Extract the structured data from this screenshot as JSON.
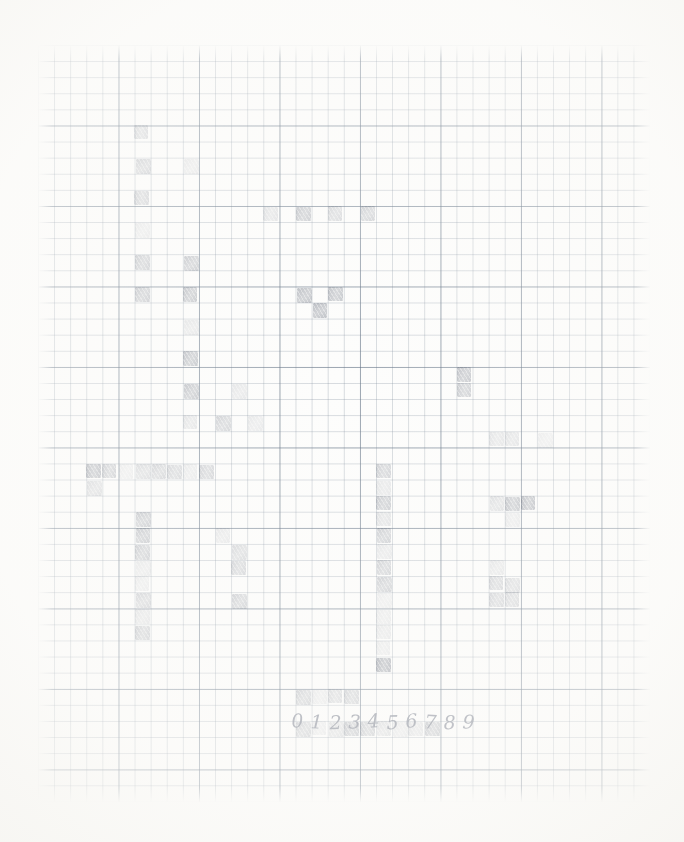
{
  "document": {
    "title": "Graph paper pencil grid drawing",
    "medium": "pencil on graph paper",
    "paper_color": "#fdfdfc",
    "grid_line_color": "#7886 96",
    "pencil_color": "#8d93a0"
  },
  "grid": {
    "origin_x": 38,
    "origin_y": 45,
    "cell_size": 16.1,
    "columns": 38,
    "rows": 47,
    "bold_every": 5,
    "fine_line_color": "#788696",
    "bold_line_color": "#607082"
  },
  "annotation": {
    "digit_row_label": "0123456789",
    "digits": [
      "0",
      "1",
      "2",
      "3",
      "4",
      "5",
      "6",
      "7",
      "8",
      "9"
    ],
    "digits_x": 288,
    "digits_y": 712
  },
  "chart_data": {
    "type": "heatmap",
    "xlabel": "",
    "ylabel": "",
    "grid": true,
    "legend": "none",
    "columns": 38,
    "rows": 47,
    "cell_size": 16.1,
    "value_range": [
      0.0,
      1.0
    ],
    "note": "Hand-shaded cells on 5mm graph paper; value = pencil darkness 0..1",
    "cells": [
      {
        "col": 6,
        "row": 5,
        "v": 0.3
      },
      {
        "col": 6,
        "row": 7,
        "v": 0.36
      },
      {
        "col": 6,
        "row": 9,
        "v": 0.34
      },
      {
        "col": 6,
        "row": 11,
        "v": 0.16
      },
      {
        "col": 6,
        "row": 13,
        "v": 0.4
      },
      {
        "col": 6,
        "row": 15,
        "v": 0.42
      },
      {
        "col": 9,
        "row": 7,
        "v": 0.17
      },
      {
        "col": 14,
        "row": 10,
        "v": 0.22
      },
      {
        "col": 16,
        "row": 10,
        "v": 0.42
      },
      {
        "col": 18,
        "row": 10,
        "v": 0.3
      },
      {
        "col": 20,
        "row": 10,
        "v": 0.36
      },
      {
        "col": 16,
        "row": 15,
        "v": 0.48
      },
      {
        "col": 18,
        "row": 15,
        "v": 0.44
      },
      {
        "col": 17,
        "row": 16,
        "v": 0.5
      },
      {
        "col": 9,
        "row": 13,
        "v": 0.42
      },
      {
        "col": 9,
        "row": 15,
        "v": 0.46
      },
      {
        "col": 9,
        "row": 17,
        "v": 0.18
      },
      {
        "col": 9,
        "row": 19,
        "v": 0.46
      },
      {
        "col": 9,
        "row": 21,
        "v": 0.44
      },
      {
        "col": 9,
        "row": 23,
        "v": 0.2
      },
      {
        "col": 12,
        "row": 21,
        "v": 0.18
      },
      {
        "col": 13,
        "row": 23,
        "v": 0.16
      },
      {
        "col": 11,
        "row": 23,
        "v": 0.34
      },
      {
        "col": 26,
        "row": 20,
        "v": 0.46
      },
      {
        "col": 26,
        "row": 21,
        "v": 0.38
      },
      {
        "col": 29,
        "row": 24,
        "v": 0.22
      },
      {
        "col": 31,
        "row": 24,
        "v": 0.14
      },
      {
        "col": 3,
        "row": 26,
        "v": 0.52
      },
      {
        "col": 4,
        "row": 26,
        "v": 0.4
      },
      {
        "col": 5,
        "row": 26,
        "v": 0.14
      },
      {
        "col": 6,
        "row": 26,
        "v": 0.28
      },
      {
        "col": 7,
        "row": 26,
        "v": 0.34
      },
      {
        "col": 8,
        "row": 26,
        "v": 0.32
      },
      {
        "col": 9,
        "row": 26,
        "v": 0.16
      },
      {
        "col": 10,
        "row": 26,
        "v": 0.34
      },
      {
        "col": 3,
        "row": 27,
        "v": 0.28
      },
      {
        "col": 6,
        "row": 29,
        "v": 0.44
      },
      {
        "col": 6,
        "row": 30,
        "v": 0.46
      },
      {
        "col": 6,
        "row": 31,
        "v": 0.42
      },
      {
        "col": 6,
        "row": 32,
        "v": 0.18
      },
      {
        "col": 6,
        "row": 33,
        "v": 0.16
      },
      {
        "col": 6,
        "row": 34,
        "v": 0.36
      },
      {
        "col": 6,
        "row": 35,
        "v": 0.22
      },
      {
        "col": 6,
        "row": 36,
        "v": 0.4
      },
      {
        "col": 11,
        "row": 30,
        "v": 0.18
      },
      {
        "col": 12,
        "row": 31,
        "v": 0.3
      },
      {
        "col": 12,
        "row": 32,
        "v": 0.34
      },
      {
        "col": 12,
        "row": 34,
        "v": 0.38
      },
      {
        "col": 21,
        "row": 26,
        "v": 0.34
      },
      {
        "col": 21,
        "row": 27,
        "v": 0.18
      },
      {
        "col": 21,
        "row": 28,
        "v": 0.4
      },
      {
        "col": 21,
        "row": 29,
        "v": 0.22
      },
      {
        "col": 21,
        "row": 30,
        "v": 0.38
      },
      {
        "col": 21,
        "row": 31,
        "v": 0.18
      },
      {
        "col": 21,
        "row": 32,
        "v": 0.36
      },
      {
        "col": 21,
        "row": 33,
        "v": 0.38
      },
      {
        "col": 21,
        "row": 34,
        "v": 0.14
      },
      {
        "col": 21,
        "row": 35,
        "v": 0.16
      },
      {
        "col": 21,
        "row": 36,
        "v": 0.18
      },
      {
        "col": 21,
        "row": 37,
        "v": 0.16
      },
      {
        "col": 21,
        "row": 38,
        "v": 0.62
      },
      {
        "col": 28,
        "row": 24,
        "v": 0.2
      },
      {
        "col": 28,
        "row": 28,
        "v": 0.26
      },
      {
        "col": 29,
        "row": 28,
        "v": 0.46
      },
      {
        "col": 30,
        "row": 28,
        "v": 0.52
      },
      {
        "col": 29,
        "row": 29,
        "v": 0.16
      },
      {
        "col": 28,
        "row": 32,
        "v": 0.2
      },
      {
        "col": 28,
        "row": 33,
        "v": 0.34
      },
      {
        "col": 29,
        "row": 33,
        "v": 0.3
      },
      {
        "col": 28,
        "row": 34,
        "v": 0.34
      },
      {
        "col": 29,
        "row": 34,
        "v": 0.32
      },
      {
        "col": 16,
        "row": 40,
        "v": 0.38
      },
      {
        "col": 17,
        "row": 40,
        "v": 0.16
      },
      {
        "col": 18,
        "row": 40,
        "v": 0.3
      },
      {
        "col": 19,
        "row": 40,
        "v": 0.36
      },
      {
        "col": 16,
        "row": 42,
        "v": 0.38
      },
      {
        "col": 17,
        "row": 42,
        "v": 0.16
      },
      {
        "col": 18,
        "row": 42,
        "v": 0.26
      },
      {
        "col": 19,
        "row": 42,
        "v": 0.44
      },
      {
        "col": 20,
        "row": 42,
        "v": 0.4
      },
      {
        "col": 21,
        "row": 42,
        "v": 0.26
      },
      {
        "col": 22,
        "row": 42,
        "v": 0.18
      },
      {
        "col": 23,
        "row": 42,
        "v": 0.22
      },
      {
        "col": 24,
        "row": 42,
        "v": 0.44
      }
    ]
  }
}
